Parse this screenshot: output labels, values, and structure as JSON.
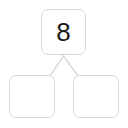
{
  "diagram": {
    "type": "number-bond",
    "colors": {
      "background": "#ffffff",
      "box_border": "#d8d8d8",
      "connector_line": "#d8d8d8",
      "value_text": "#1a1a1a"
    },
    "whole": {
      "label": "8",
      "value": 8,
      "filled": true
    },
    "parts": [
      {
        "label": "",
        "value": null,
        "filled": false
      },
      {
        "label": "",
        "value": null,
        "filled": false
      }
    ],
    "connectors": [
      {
        "name": "whole-to-left-part",
        "from": "whole-box",
        "to": "part-box-left"
      },
      {
        "name": "whole-to-right-part",
        "from": "whole-box",
        "to": "part-box-right"
      }
    ]
  }
}
